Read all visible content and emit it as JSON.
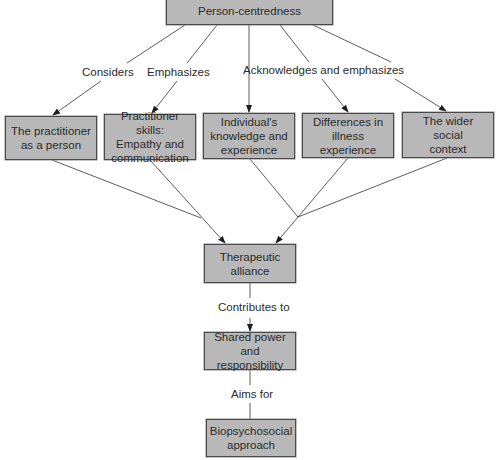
{
  "diagram": {
    "title": "Person-centredness",
    "nodes": {
      "root": "Person-centredness",
      "practitioner_person": "The practitioner\nas a person",
      "practitioner_skills": "Practitioner skills:\nEmpathy and\ncommunication",
      "individual_knowledge": "Individual's\nknowledge and\nexperience",
      "illness_differences": "Differences in\nillness\nexperience",
      "social_context": "The wider\nsocial\ncontext",
      "therapeutic_alliance": "Therapeutic\nalliance",
      "shared_power": "Shared power and\nresponsibility",
      "biopsychosocial": "Biopsychosocial\napproach"
    },
    "edge_labels": {
      "considers": "Considers",
      "emphasizes": "Emphasizes",
      "acknowledges": "Acknowledges and emphasizes",
      "contributes": "Contributes to",
      "aims": "Aims for"
    },
    "edges": [
      {
        "from": "root",
        "to": "practitioner_person",
        "label": "considers"
      },
      {
        "from": "root",
        "to": "practitioner_skills",
        "label": "emphasizes"
      },
      {
        "from": "root",
        "to": "individual_knowledge",
        "label": "acknowledges"
      },
      {
        "from": "root",
        "to": "illness_differences",
        "label": "acknowledges"
      },
      {
        "from": "root",
        "to": "social_context",
        "label": "acknowledges"
      },
      {
        "from": "practitioner_person",
        "to": "therapeutic_alliance"
      },
      {
        "from": "practitioner_skills",
        "to": "therapeutic_alliance"
      },
      {
        "from": "individual_knowledge",
        "to": "therapeutic_alliance"
      },
      {
        "from": "illness_differences",
        "to": "therapeutic_alliance"
      },
      {
        "from": "social_context",
        "to": "therapeutic_alliance"
      },
      {
        "from": "therapeutic_alliance",
        "to": "shared_power",
        "label": "contributes"
      },
      {
        "from": "shared_power",
        "to": "biopsychosocial",
        "label": "aims"
      }
    ],
    "colors": {
      "box_fill": "#b8b8b8",
      "line": "#3a3a3a"
    }
  }
}
